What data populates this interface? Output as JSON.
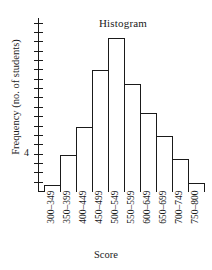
{
  "chart_data": {
    "type": "bar",
    "title": "Histogram",
    "xlabel": "Score",
    "ylabel": "Frequency (no. of students)",
    "categories": [
      "300–349",
      "350–399",
      "400–449",
      "450–499",
      "500–549",
      "550–599",
      "600–649",
      "650–699",
      "700–749",
      "750–800"
    ],
    "values": [
      0.7,
      4,
      7,
      13,
      16.5,
      11.5,
      8.5,
      6,
      3.5,
      1
    ],
    "ylim": [
      0,
      18.5
    ],
    "y_tick_labels": [
      "4"
    ],
    "y_tick_count": 18,
    "y_tick_interval": 1,
    "grid": false,
    "legend": false,
    "bar_fill": "#ffffff",
    "bar_edge": "#1a1a1a"
  },
  "axis": {
    "y_label_text": "Frequency (no. of students)",
    "y_tick_4": "4",
    "x_title": "Score"
  },
  "title": {
    "text": "Histogram"
  }
}
